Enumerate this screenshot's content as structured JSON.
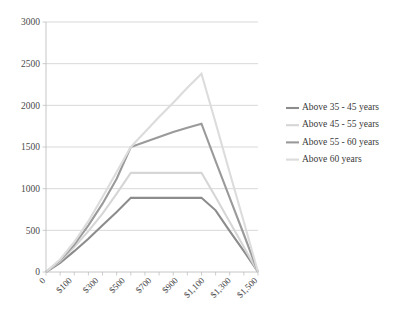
{
  "chart_data": {
    "type": "line",
    "title": "",
    "xlabel": "",
    "ylabel": "",
    "ylim": [
      0,
      3000
    ],
    "ytick_values": [
      0,
      500,
      1000,
      1500,
      2000,
      2500,
      3000
    ],
    "ytick_labels": [
      "0",
      "500",
      "1000",
      "1500",
      "2000",
      "2500",
      "3000"
    ],
    "grid": true,
    "legend_position": "right",
    "x": [
      0,
      100,
      200,
      300,
      400,
      500,
      600,
      700,
      800,
      900,
      1000,
      1100,
      1200,
      1300,
      1400,
      1500
    ],
    "xtick_labels": [
      "0",
      "",
      "$100",
      "",
      "$300",
      "",
      "$500",
      "",
      "$700",
      "",
      "$900",
      "",
      "$1,100",
      "",
      "$1,300",
      "",
      "$1,500"
    ],
    "xtick_labels_shown": [
      "0",
      "$100",
      "$300",
      "$500",
      "$700",
      "$900",
      "$1,100",
      "$1,300",
      "$1,500"
    ],
    "series": [
      {
        "name": "Above 35 - 45 years",
        "color": "#8c8c8c",
        "width": 2.1,
        "values": [
          0,
          110,
          250,
          400,
          560,
          720,
          890,
          890,
          890,
          890,
          890,
          890,
          740,
          490,
          250,
          0
        ]
      },
      {
        "name": "Above 45 - 55 years",
        "color": "#d6d6d6",
        "width": 2.1,
        "values": [
          0,
          130,
          300,
          490,
          700,
          940,
          1190,
          1190,
          1190,
          1190,
          1190,
          1190,
          900,
          600,
          300,
          0
        ]
      },
      {
        "name": "Above 55 - 60 years",
        "color": "#9a9a9a",
        "width": 2.1,
        "values": [
          0,
          140,
          330,
          560,
          820,
          1120,
          1500,
          1560,
          1620,
          1680,
          1730,
          1780,
          1330,
          890,
          450,
          0
        ]
      },
      {
        "name": "Above 60 years",
        "color": "#dcdcdc",
        "width": 2.1,
        "values": [
          0,
          150,
          360,
          610,
          900,
          1200,
          1500,
          1680,
          1860,
          2030,
          2210,
          2380,
          1790,
          1190,
          600,
          0
        ]
      }
    ]
  },
  "legend": {
    "items": [
      {
        "label": "Above 35 - 45 years",
        "color": "#8c8c8c"
      },
      {
        "label": "Above 45 - 55 years",
        "color": "#d6d6d6"
      },
      {
        "label": "Above 55 - 60 years",
        "color": "#9a9a9a"
      },
      {
        "label": "Above 60 years",
        "color": "#dcdcdc"
      }
    ]
  }
}
